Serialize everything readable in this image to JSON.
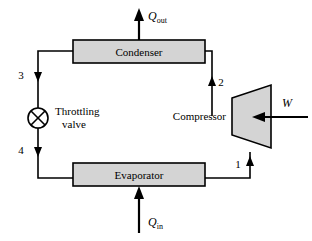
{
  "diagram": {
    "colors": {
      "component_fill": "#d4d4d4",
      "line": "#000000",
      "background": "#ffffff"
    },
    "components": {
      "condenser": {
        "label": "Condenser",
        "x": 73,
        "y": 40,
        "width": 132,
        "height": 23
      },
      "evaporator": {
        "label": "Evaporator",
        "x": 73,
        "y": 163,
        "width": 132,
        "height": 23
      },
      "throttling_valve": {
        "label_line1": "Throttling",
        "label_line2": "valve",
        "cx": 38,
        "cy": 118,
        "r": 10
      },
      "compressor": {
        "label": "Compressor",
        "points": "232,98 271,85 271,148 232,135"
      }
    },
    "energy_flows": {
      "heat_out": {
        "symbol": "Q",
        "subscript": "out",
        "direction": "up",
        "label_x": 147,
        "label_y": 18
      },
      "heat_in": {
        "symbol": "Q",
        "subscript": "in",
        "direction": "up",
        "label_x": 147,
        "label_y": 229
      },
      "work_in": {
        "symbol": "W",
        "subscript": "",
        "direction": "left",
        "label_x": 286,
        "label_y": 104
      }
    },
    "state_points": [
      {
        "id": "1",
        "label": "1",
        "x": 237,
        "y": 164,
        "note": "compressor inlet"
      },
      {
        "id": "2",
        "label": "2",
        "x": 219,
        "y": 82,
        "note": "compressor outlet"
      },
      {
        "id": "3",
        "label": "3",
        "x": 24,
        "y": 75,
        "note": "condenser outlet"
      },
      {
        "id": "4",
        "label": "4",
        "x": 24,
        "y": 150,
        "note": "valve outlet"
      }
    ]
  }
}
